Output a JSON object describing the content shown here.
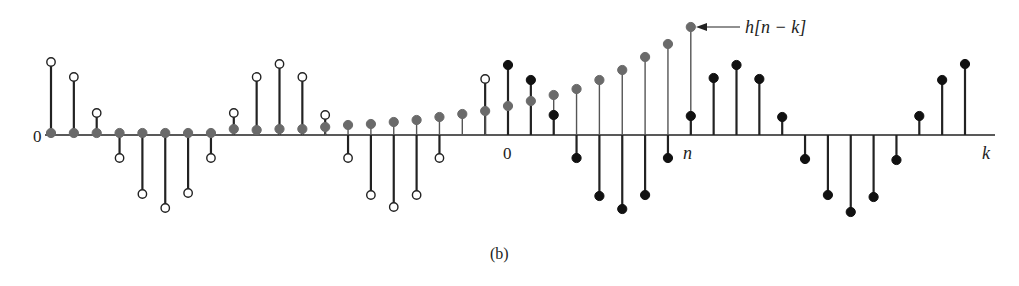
{
  "chart_data": {
    "type": "stem",
    "title": "",
    "caption": "(b)",
    "xlabel": "k",
    "ylabel": "",
    "axis_labels": {
      "origin_left": "0",
      "zero_tick": "0",
      "n_tick": "n",
      "k_axis": "k"
    },
    "annotation": {
      "text": "h[n − k]",
      "points_to": "gray stem at k = n"
    },
    "index_note": "k indices relative to the '0' tick; n = 8",
    "series": [
      {
        "name": "x[k] (not overlapping, open circles)",
        "marker": "open-circle",
        "color": "#222222",
        "k": [
          -20,
          -19,
          -18,
          -17,
          -16,
          -15,
          -14,
          -13,
          -12,
          -11,
          -10,
          -9,
          -8,
          -7,
          -6,
          -5,
          -4,
          -3,
          -1
        ],
        "values": [
          0.73,
          0.58,
          0.22,
          -0.23,
          -0.59,
          -0.73,
          -0.58,
          -0.23,
          0.22,
          0.58,
          0.71,
          0.58,
          0.2,
          -0.23,
          -0.6,
          -0.72,
          -0.6,
          -0.23,
          0.56
        ]
      },
      {
        "name": "h[n − k]",
        "marker": "filled-circle",
        "color": "#6a6a6a",
        "k": [
          -20,
          -19,
          -18,
          -17,
          -16,
          -15,
          -14,
          -13,
          -12,
          -11,
          -10,
          -9,
          -8,
          -7,
          -6,
          -5,
          -4,
          -3,
          -2,
          -1,
          0,
          1,
          2,
          3,
          4,
          5,
          6,
          7,
          8
        ],
        "values": [
          0.02,
          0.02,
          0.02,
          0.02,
          0.02,
          0.02,
          0.02,
          0.02,
          0.06,
          0.05,
          0.06,
          0.06,
          0.08,
          0.1,
          0.11,
          0.13,
          0.15,
          0.18,
          0.21,
          0.24,
          0.29,
          0.34,
          0.4,
          0.46,
          0.55,
          0.65,
          0.78,
          0.91,
          1.08
        ]
      },
      {
        "name": "x[k] (filled black)",
        "marker": "filled-circle",
        "color": "#111111",
        "k": [
          0,
          1,
          2,
          3,
          4,
          5,
          6,
          7,
          8,
          9,
          10,
          11,
          12,
          13,
          14,
          15,
          16,
          17,
          18,
          19,
          20
        ],
        "values": [
          0.7,
          0.55,
          0.2,
          -0.23,
          -0.61,
          -0.74,
          -0.6,
          -0.23,
          0.19,
          0.57,
          0.7,
          0.56,
          0.18,
          -0.24,
          -0.6,
          -0.77,
          -0.62,
          -0.25,
          0.19,
          0.55,
          0.71
        ]
      }
    ],
    "layout": {
      "grid": false,
      "legend": "none",
      "axis_y_px": 135,
      "k0_x_px": 508,
      "dk_px": 22.85,
      "unit_px": 100
    }
  }
}
